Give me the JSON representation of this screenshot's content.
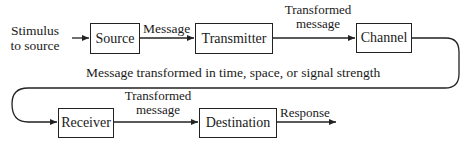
{
  "diagram": {
    "type": "communication-process-flow",
    "input": {
      "label_line1": "Stimulus",
      "label_line2": "to source"
    },
    "nodes": [
      {
        "id": "source",
        "label": "Source"
      },
      {
        "id": "transmitter",
        "label": "Transmitter"
      },
      {
        "id": "channel",
        "label": "Channel"
      },
      {
        "id": "receiver",
        "label": "Receiver"
      },
      {
        "id": "destination",
        "label": "Destination"
      }
    ],
    "edges": [
      {
        "from": "input",
        "to": "source",
        "label": ""
      },
      {
        "from": "source",
        "to": "transmitter",
        "label": "Message"
      },
      {
        "from": "transmitter",
        "to": "channel",
        "label_line1": "Transformed",
        "label_line2": "message"
      },
      {
        "from": "channel",
        "to": "receiver",
        "label": "Message transformed in time, space, or signal strength"
      },
      {
        "from": "receiver",
        "to": "destination",
        "label_line1": "Transformed",
        "label_line2": "message"
      },
      {
        "from": "destination",
        "to": "output",
        "label": "Response"
      }
    ],
    "colors": {
      "line": "#222222",
      "background": "#ffffff",
      "text": "#1a1a1a"
    }
  }
}
